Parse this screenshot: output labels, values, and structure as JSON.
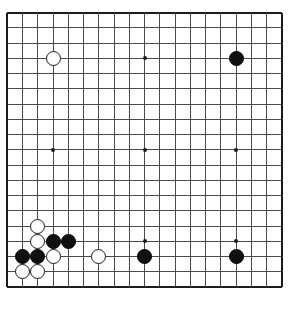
{
  "board": {
    "name": "go-board",
    "type": "go-goban",
    "size": 19,
    "geometry": {
      "origin_x": 7.4,
      "origin_y": 12.5,
      "spacing": 15.25,
      "stone_diameter": 15,
      "star_dot_diameter": 4
    },
    "colors": {
      "background": "#ffffff",
      "grid_line": "#4a4a4a",
      "border_line": "#1c1c1c",
      "black_stone": "#101010",
      "white_stone_fill": "#ffffff",
      "white_stone_edge": "#1a1a1a",
      "star_point": "#1c1c1c"
    },
    "star_points": [
      {
        "col": 4,
        "row": 4
      },
      {
        "col": 10,
        "row": 4
      },
      {
        "col": 16,
        "row": 4
      },
      {
        "col": 4,
        "row": 10
      },
      {
        "col": 10,
        "row": 10
      },
      {
        "col": 16,
        "row": 10
      },
      {
        "col": 4,
        "row": 16
      },
      {
        "col": 10,
        "row": 16
      },
      {
        "col": 16,
        "row": 16
      }
    ],
    "stones": [
      {
        "color": "white",
        "col": 4,
        "row": 4,
        "label": "D16"
      },
      {
        "color": "black",
        "col": 16,
        "row": 4,
        "label": "Q16"
      },
      {
        "color": "white",
        "col": 3,
        "row": 15,
        "label": "C5"
      },
      {
        "color": "white",
        "col": 3,
        "row": 16,
        "label": "C4"
      },
      {
        "color": "black",
        "col": 4,
        "row": 16,
        "label": "D4"
      },
      {
        "color": "black",
        "col": 5,
        "row": 16,
        "label": "E4"
      },
      {
        "color": "black",
        "col": 2,
        "row": 17,
        "label": "B3"
      },
      {
        "color": "black",
        "col": 3,
        "row": 17,
        "label": "C3"
      },
      {
        "color": "white",
        "col": 4,
        "row": 17,
        "label": "D3"
      },
      {
        "color": "white",
        "col": 7,
        "row": 17,
        "label": "G3"
      },
      {
        "color": "black",
        "col": 10,
        "row": 17,
        "label": "K3"
      },
      {
        "color": "black",
        "col": 16,
        "row": 17,
        "label": "Q3"
      },
      {
        "color": "white",
        "col": 2,
        "row": 18,
        "label": "B2"
      },
      {
        "color": "white",
        "col": 3,
        "row": 18,
        "label": "C2"
      }
    ],
    "counts": {
      "black_stones": 6,
      "white_stones": 8,
      "total_stones": 14
    }
  }
}
